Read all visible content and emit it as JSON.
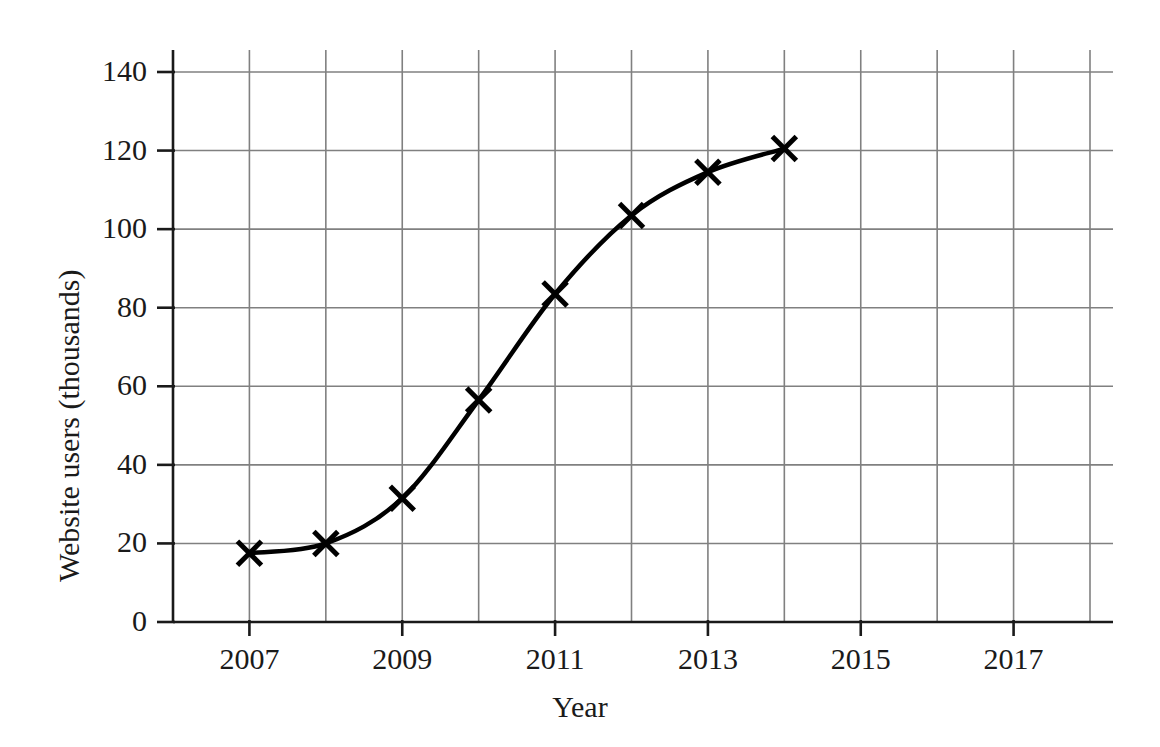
{
  "chart_data": {
    "type": "line",
    "title": "",
    "xlabel": "Year",
    "ylabel": "Website users (thousands)",
    "xlim": [
      2006,
      2018
    ],
    "ylim": [
      0,
      140
    ],
    "grid": true,
    "legend": "none",
    "marker": "cross",
    "line_color": "#000000",
    "grid_color": "#808080",
    "axis_color": "#1a1a1a",
    "x_tick_labels": [
      "2007",
      "2009",
      "2011",
      "2013",
      "2015",
      "2017"
    ],
    "x_tick_values": [
      2007,
      2009,
      2011,
      2013,
      2015,
      2017
    ],
    "x_gridline_values": [
      2006,
      2007,
      2008,
      2009,
      2010,
      2011,
      2012,
      2013,
      2014,
      2015,
      2016,
      2017,
      2018
    ],
    "y_tick_labels": [
      "0",
      "20",
      "40",
      "60",
      "80",
      "100",
      "120",
      "140"
    ],
    "y_tick_values": [
      0,
      20,
      40,
      60,
      80,
      100,
      120,
      140
    ],
    "x": [
      2007,
      2008,
      2009,
      2010,
      2011,
      2012,
      2013,
      2014
    ],
    "values": [
      17.5,
      20,
      31.5,
      56.5,
      83.5,
      103.5,
      114.5,
      120.5
    ],
    "series": [
      {
        "name": "Website users",
        "points": [
          {
            "x": 2007,
            "y": 17.5
          },
          {
            "x": 2008,
            "y": 20
          },
          {
            "x": 2009,
            "y": 31.5
          },
          {
            "x": 2010,
            "y": 56.5
          },
          {
            "x": 2011,
            "y": 83.5
          },
          {
            "x": 2012,
            "y": 103.5
          },
          {
            "x": 2013,
            "y": 114.5
          },
          {
            "x": 2014,
            "y": 120.5
          }
        ]
      }
    ]
  }
}
